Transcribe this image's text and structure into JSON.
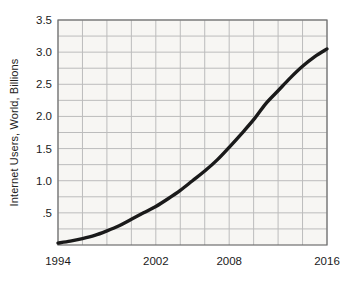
{
  "chart_data": {
    "type": "line",
    "title": "",
    "xlabel": "",
    "ylabel": "Internet Users, World, Billions",
    "xlim": [
      1994,
      2016
    ],
    "ylim": [
      0,
      3.5
    ],
    "grid": true,
    "legend": false,
    "x_tick_labels": [
      "1994",
      "2002",
      "2008",
      "2016"
    ],
    "x_tick_values": [
      1994,
      2002,
      2008,
      2016
    ],
    "y_tick_labels": [
      "3.5",
      "3.0",
      "2.5",
      "2.0",
      "1.5",
      "1.0",
      ".5"
    ],
    "y_tick_values": [
      3.5,
      3.0,
      2.5,
      2.0,
      1.5,
      1.0,
      0.5
    ],
    "x_gridline_values": [
      1994,
      1996,
      1998,
      2000,
      2002,
      2004,
      2006,
      2008,
      2010,
      2012,
      2014,
      2016
    ],
    "y_gridline_values": [
      0.25,
      0.5,
      0.75,
      1.0,
      1.25,
      1.5,
      1.75,
      2.0,
      2.25,
      2.5,
      2.75,
      3.0,
      3.25,
      3.5
    ],
    "series": [
      {
        "name": "Internet Users, World",
        "color": "#1a1a1a",
        "line_width": 3.4,
        "x": [
          1994,
          1995,
          1996,
          1997,
          1998,
          1999,
          2000,
          2001,
          2002,
          2003,
          2004,
          2005,
          2006,
          2007,
          2008,
          2009,
          2010,
          2011,
          2012,
          2013,
          2014,
          2015,
          2016
        ],
        "values": [
          0.03,
          0.06,
          0.1,
          0.15,
          0.22,
          0.3,
          0.4,
          0.5,
          0.6,
          0.72,
          0.85,
          1.0,
          1.15,
          1.32,
          1.52,
          1.73,
          1.95,
          2.2,
          2.4,
          2.6,
          2.78,
          2.93,
          3.05
        ]
      }
    ]
  },
  "colors": {
    "plot_background": "#f7f6f3",
    "grid": "#bcbcbc",
    "axis": "#6e6e6e",
    "line": "#1a1a1a",
    "text": "#1b1b1b",
    "page_background": "#ffffff"
  },
  "geometry": {
    "plot_left": 58,
    "plot_right": 327,
    "plot_top": 20,
    "plot_bottom": 245
  }
}
